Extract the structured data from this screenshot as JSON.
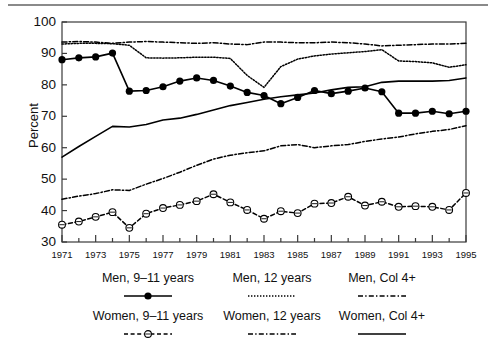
{
  "chart_data": {
    "type": "line",
    "title": "",
    "xlabel": "",
    "ylabel": "Percent",
    "xlim": [
      1971,
      1995
    ],
    "ylim": [
      30,
      100
    ],
    "ytick_values": [
      30,
      40,
      50,
      60,
      70,
      80,
      90,
      100
    ],
    "xtick_values": [
      1971,
      1973,
      1975,
      1977,
      1979,
      1981,
      1983,
      1985,
      1987,
      1989,
      1991,
      1993,
      1995
    ],
    "minor_xticks_every": 1,
    "grid": false,
    "legend_position": "below",
    "x": [
      1971,
      1972,
      1973,
      1974,
      1975,
      1976,
      1977,
      1978,
      1979,
      1980,
      1981,
      1982,
      1983,
      1984,
      1985,
      1986,
      1987,
      1988,
      1989,
      1990,
      1991,
      1992,
      1993,
      1994,
      1995
    ],
    "series": [
      {
        "name": "Men, 9-11 years",
        "style": "solid-with-filled-circles",
        "color": "#000000",
        "values": [
          88.0,
          88.6,
          88.9,
          90.1,
          78.0,
          78.2,
          79.4,
          81.2,
          82.2,
          81.4,
          79.6,
          77.6,
          76.6,
          74.0,
          76.0,
          78.2,
          77.2,
          78.0,
          79.0,
          77.8,
          71.0,
          71.0,
          71.6,
          70.8,
          71.6
        ]
      },
      {
        "name": "Men, 12 years",
        "style": "dotted",
        "color": "#000000",
        "values": [
          93.0,
          93.2,
          93.2,
          93.1,
          92.6,
          88.6,
          88.5,
          88.6,
          88.8,
          88.8,
          88.4,
          83.0,
          79.2,
          85.8,
          88.2,
          89.2,
          89.8,
          90.2,
          90.6,
          91.2,
          87.6,
          87.4,
          87.0,
          85.6,
          86.4
        ]
      },
      {
        "name": "Men, Col 4+",
        "style": "dash-dot",
        "color": "#000000",
        "values": [
          93.6,
          93.8,
          93.6,
          93.2,
          93.6,
          93.8,
          93.6,
          93.4,
          93.2,
          93.4,
          93.0,
          92.8,
          93.6,
          93.6,
          93.4,
          93.4,
          93.6,
          93.4,
          93.0,
          92.4,
          92.6,
          92.8,
          93.0,
          93.0,
          93.2
        ]
      },
      {
        "name": "Women, 9-11 years",
        "style": "dashed-with-open-circles",
        "color": "#000000",
        "values": [
          35.5,
          36.5,
          38.0,
          39.5,
          34.5,
          39.0,
          40.8,
          41.8,
          43.0,
          45.2,
          42.6,
          40.2,
          37.4,
          39.8,
          39.2,
          42.2,
          42.4,
          44.4,
          41.6,
          42.8,
          41.2,
          41.4,
          41.2,
          40.2,
          45.6
        ]
      },
      {
        "name": "Women, 12 years",
        "style": "dash-dot",
        "color": "#000000",
        "values": [
          43.6,
          44.6,
          45.4,
          46.6,
          46.4,
          48.4,
          50.2,
          52.2,
          54.4,
          56.4,
          57.6,
          58.4,
          59.0,
          60.6,
          61.0,
          60.0,
          60.6,
          61.0,
          62.0,
          62.8,
          63.4,
          64.4,
          65.2,
          65.8,
          67.0
        ]
      },
      {
        "name": "Women, Col 4+",
        "style": "solid",
        "color": "#000000",
        "values": [
          57.0,
          60.4,
          63.6,
          66.8,
          66.6,
          67.4,
          68.8,
          69.4,
          70.6,
          72.0,
          73.4,
          74.4,
          75.4,
          76.2,
          76.8,
          77.4,
          78.4,
          79.2,
          79.4,
          80.8,
          81.2,
          81.2,
          81.2,
          81.4,
          82.2
        ]
      }
    ]
  },
  "axis": {
    "ylabel": "Percent",
    "yticks": [
      "100",
      "90",
      "80",
      "70",
      "60",
      "50",
      "40",
      "30"
    ],
    "xticks": [
      "1971",
      "1973",
      "1975",
      "1977",
      "1979",
      "1981",
      "1983",
      "1985",
      "1987",
      "1989",
      "1991",
      "1993",
      "1995"
    ]
  },
  "legend": {
    "row1": [
      {
        "label": "Men, 9–11 years",
        "style": "solid-with-filled-circles"
      },
      {
        "label": "Men, 12 years",
        "style": "dotted"
      },
      {
        "label": "Men, Col 4+",
        "style": "dash-dot"
      }
    ],
    "row2": [
      {
        "label": "Women, 9–11 years",
        "style": "dashed-with-open-circles"
      },
      {
        "label": "Women, 12 years",
        "style": "dash-dot"
      },
      {
        "label": "Women, Col 4+",
        "style": "solid"
      }
    ]
  }
}
